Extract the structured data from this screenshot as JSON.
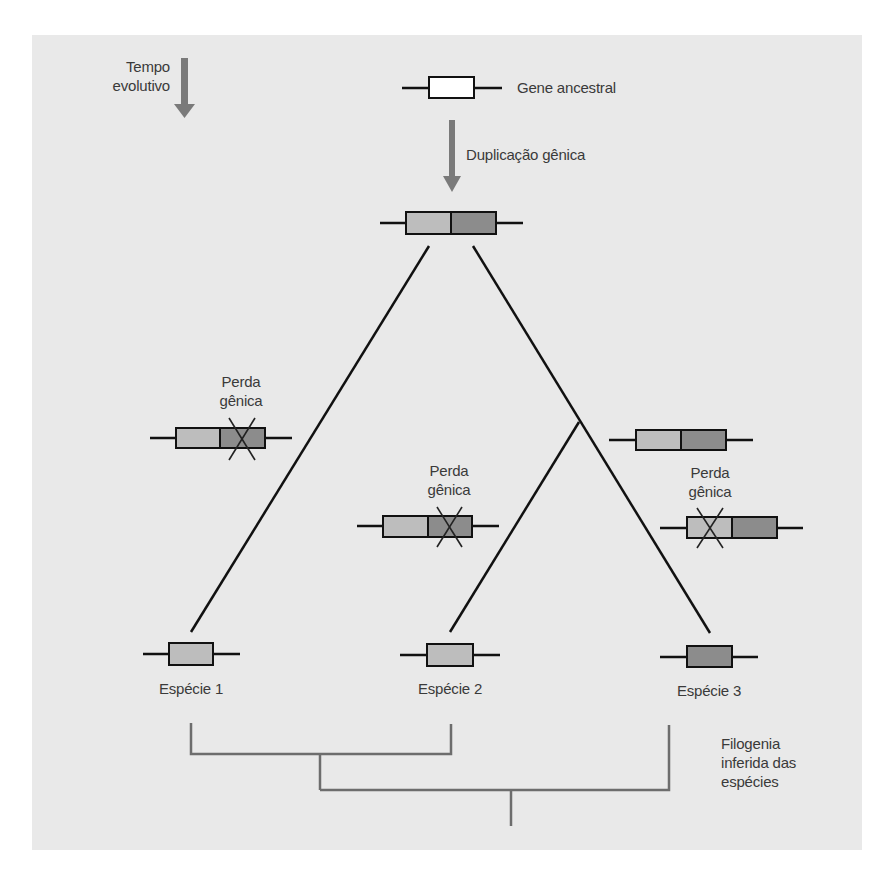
{
  "labels": {
    "time_line1": "Tempo",
    "time_line2": "evolutivo",
    "ancestral_gene": "Gene ancestral",
    "duplication": "Duplicação gênica",
    "loss_left_line1": "Perda",
    "loss_left_line2": "gênica",
    "loss_mid_line1": "Perda",
    "loss_mid_line2": "gênica",
    "loss_right_line1": "Perda",
    "loss_right_line2": "gênica",
    "species1": "Espécie 1",
    "species2": "Espécie 2",
    "species3": "Espécie 3",
    "phylogeny_line1": "Filogenia",
    "phylogeny_line2": "inferida das",
    "phylogeny_line3": "espécies"
  },
  "colors": {
    "panel_bg": "#e9e9e9",
    "gene_light": "#bdbdbd",
    "gene_dark": "#8c8c8c",
    "gene_ancestral": "#ffffff",
    "arrow": "#7a7a7a",
    "phylogeny": "#6d6d6d",
    "line": "#111111"
  },
  "genes": {
    "ancestral": {
      "type": "single",
      "fill": "white"
    },
    "duplicated": {
      "type": "double"
    },
    "left_branch": {
      "type": "double",
      "lost": "dark"
    },
    "middle_branch": {
      "type": "double",
      "lost": "dark"
    },
    "right_upper": {
      "type": "double"
    },
    "right_lower": {
      "type": "double",
      "lost": "light"
    },
    "species1": {
      "type": "single",
      "fill": "light"
    },
    "species2": {
      "type": "single",
      "fill": "light"
    },
    "species3": {
      "type": "single",
      "fill": "dark"
    }
  }
}
